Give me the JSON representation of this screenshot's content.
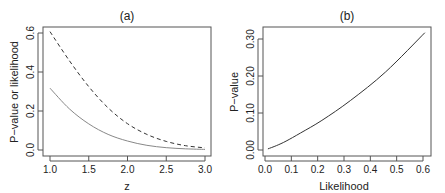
{
  "chart_data": [
    {
      "type": "line",
      "title": "(a)",
      "xlabel": "z",
      "ylabel": "P−value or likelihood",
      "xlim": [
        1.0,
        3.0
      ],
      "ylim": [
        0.0,
        0.6
      ],
      "xticks": [
        "1.0",
        "1.5",
        "2.0",
        "2.5",
        "3.0"
      ],
      "yticks": [
        "0.0",
        "0.2",
        "0.4",
        "0.6"
      ],
      "grid": false,
      "legend": null,
      "x": [
        1.0,
        1.25,
        1.5,
        1.75,
        2.0,
        2.25,
        2.5,
        2.75,
        3.0
      ],
      "series": [
        {
          "name": "P-value",
          "style": "solid",
          "color": "#888888",
          "values": [
            0.317,
            0.211,
            0.134,
            0.08,
            0.046,
            0.024,
            0.012,
            0.006,
            0.003
          ]
        },
        {
          "name": "likelihood",
          "style": "dashed",
          "color": "#333333",
          "values": [
            0.607,
            0.458,
            0.325,
            0.216,
            0.135,
            0.08,
            0.044,
            0.022,
            0.011
          ]
        }
      ]
    },
    {
      "type": "line",
      "title": "(b)",
      "xlabel": "Likelihood",
      "ylabel": "P−value",
      "xlim": [
        0.0,
        0.6
      ],
      "ylim": [
        0.0,
        0.3
      ],
      "xticks": [
        "0.0",
        "0.1",
        "0.2",
        "0.3",
        "0.4",
        "0.5",
        "0.6"
      ],
      "yticks": [
        "0.00",
        "0.10",
        "0.20",
        "0.30"
      ],
      "grid": false,
      "legend": null,
      "series": [
        {
          "name": "P-value vs likelihood",
          "style": "solid",
          "color": "#333333",
          "x": [
            0.011,
            0.044,
            0.08,
            0.135,
            0.216,
            0.325,
            0.458,
            0.607
          ],
          "values": [
            0.003,
            0.012,
            0.024,
            0.046,
            0.08,
            0.134,
            0.211,
            0.317
          ]
        }
      ]
    }
  ]
}
